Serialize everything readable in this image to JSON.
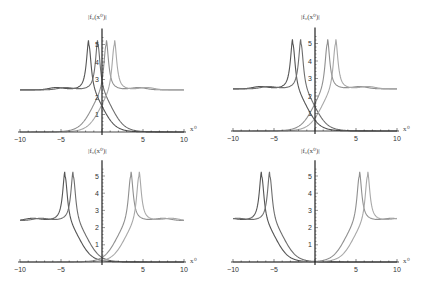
{
  "chart_data": [
    {
      "type": "line",
      "panel": "top-left",
      "title": "",
      "ylabel": "|f0(x0)|",
      "xlabel": "x0",
      "xlim": [
        -10,
        10
      ],
      "ylim": [
        0,
        5.8
      ],
      "x_ticks": [
        -10,
        -5,
        5,
        10
      ],
      "y_ticks": [
        1,
        2,
        3,
        4,
        5
      ],
      "grid": false,
      "plateau": 2.4,
      "peak_height": 5.5,
      "series": [
        {
          "name": "curve-1",
          "peak_x": -1.6,
          "falls": "right",
          "color": "#555555"
        },
        {
          "name": "curve-2",
          "peak_x": -0.5,
          "falls": "right",
          "color": "#6e6e6e"
        },
        {
          "name": "curve-3",
          "peak_x": 0.5,
          "falls": "left",
          "color": "#909090"
        },
        {
          "name": "curve-4",
          "peak_x": 1.5,
          "falls": "left",
          "color": "#a8a8a8"
        }
      ]
    },
    {
      "type": "line",
      "panel": "top-right",
      "title": "",
      "ylabel": "|f0(x0)|",
      "xlabel": "x0",
      "xlim": [
        -10,
        10
      ],
      "ylim": [
        0,
        5.8
      ],
      "x_ticks": [
        -10,
        -5,
        5,
        10
      ],
      "y_ticks": [
        1,
        2,
        3,
        4,
        5
      ],
      "grid": false,
      "plateau": 2.4,
      "peak_height": 5.5,
      "series": [
        {
          "name": "curve-1",
          "peak_x": -2.7,
          "falls": "right",
          "color": "#555555"
        },
        {
          "name": "curve-2",
          "peak_x": -1.7,
          "falls": "right",
          "color": "#6e6e6e"
        },
        {
          "name": "curve-3",
          "peak_x": 1.5,
          "falls": "left",
          "color": "#909090"
        },
        {
          "name": "curve-4",
          "peak_x": 2.5,
          "falls": "left",
          "color": "#a8a8a8"
        }
      ]
    },
    {
      "type": "line",
      "panel": "bottom-left",
      "title": "",
      "ylabel": "|f0(x0)|",
      "xlabel": "x0",
      "xlim": [
        -10,
        10
      ],
      "ylim": [
        0,
        5.8
      ],
      "x_ticks": [
        -10,
        -5,
        5,
        10
      ],
      "y_ticks": [
        1,
        2,
        3,
        4,
        5
      ],
      "grid": false,
      "plateau": 2.4,
      "peak_height": 5.5,
      "series": [
        {
          "name": "curve-1",
          "peak_x": -4.5,
          "falls": "right",
          "color": "#555555"
        },
        {
          "name": "curve-2",
          "peak_x": -3.5,
          "falls": "right",
          "color": "#6e6e6e"
        },
        {
          "name": "curve-3",
          "peak_x": 3.5,
          "falls": "left",
          "color": "#909090"
        },
        {
          "name": "curve-4",
          "peak_x": 4.5,
          "falls": "left",
          "color": "#a8a8a8"
        }
      ]
    },
    {
      "type": "line",
      "panel": "bottom-right",
      "title": "",
      "ylabel": "|f0(x0)|",
      "xlabel": "x0",
      "xlim": [
        -10,
        10
      ],
      "ylim": [
        0,
        5.8
      ],
      "x_ticks": [
        -10,
        -5,
        5,
        10
      ],
      "y_ticks": [
        1,
        2,
        3,
        4,
        5
      ],
      "grid": false,
      "plateau": 2.4,
      "peak_height": 5.5,
      "series": [
        {
          "name": "curve-1",
          "peak_x": -6.5,
          "falls": "right",
          "color": "#555555"
        },
        {
          "name": "curve-2",
          "peak_x": -5.5,
          "falls": "right",
          "color": "#6e6e6e"
        },
        {
          "name": "curve-3",
          "peak_x": 5.4,
          "falls": "left",
          "color": "#909090"
        },
        {
          "name": "curve-4",
          "peak_x": 6.4,
          "falls": "left",
          "color": "#a8a8a8"
        }
      ]
    }
  ],
  "labels": {
    "ylabel_text": "|f₀(x⁰)|",
    "xlabel_text": "x⁰"
  }
}
